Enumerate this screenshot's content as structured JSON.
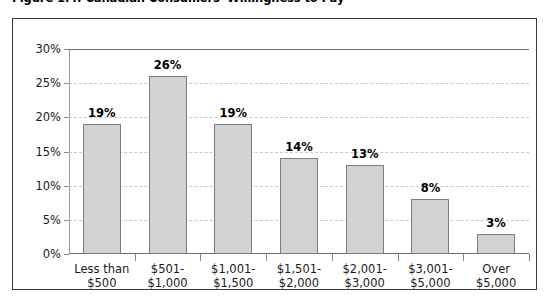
{
  "figure": {
    "title": "Figure 1.4: Canadian Consumers' Willingness to Pay"
  },
  "chart_data": {
    "type": "bar",
    "title": "Figure 1.4: Canadian Consumers' Willingness to Pay",
    "xlabel": "",
    "ylabel": "",
    "ylim": [
      0,
      30
    ],
    "grid": true,
    "legend": null,
    "y_ticks": [
      "0%",
      "5%",
      "10%",
      "15%",
      "20%",
      "25%",
      "30%"
    ],
    "y_tick_values": [
      0,
      5,
      10,
      15,
      20,
      25,
      30
    ],
    "categories": [
      "Less than $500",
      "$501-$1,000",
      "$1,001-$1,500",
      "$1,501-$2,000",
      "$2,001-$3,000",
      "$3,001-$5,000",
      "Over $5,000"
    ],
    "category_lines": [
      [
        "Less than",
        "$500"
      ],
      [
        "$501-",
        "$1,000"
      ],
      [
        "$1,001-",
        "$1,500"
      ],
      [
        "$1,501-",
        "$2,000"
      ],
      [
        "$2,001-",
        "$3,000"
      ],
      [
        "$3,001-",
        "$5,000"
      ],
      [
        "Over",
        "$5,000"
      ]
    ],
    "values": [
      19,
      26,
      19,
      14,
      13,
      8,
      3
    ],
    "data_labels": [
      "19%",
      "26%",
      "19%",
      "14%",
      "13%",
      "8%",
      "3%"
    ],
    "colors": {
      "bar_fill": "#d2d2d2",
      "bar_border": "#7d7d7d",
      "gridline": "#c9c9c9",
      "axis": "#6b6b6b",
      "frame": "#3a3a3a",
      "text": "#1a1a1a"
    }
  }
}
